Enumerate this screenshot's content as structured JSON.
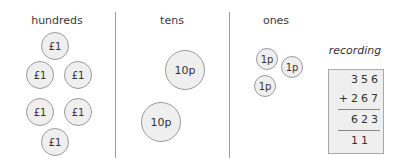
{
  "columns": {
    "hundreds": {
      "label": "hundreds",
      "coin_label": "£1",
      "count": 6
    },
    "tens": {
      "label": "tens",
      "coin_label": "10p",
      "count": 2
    },
    "ones": {
      "label": "ones",
      "coin_label": "1p",
      "count": 3
    }
  },
  "coins": {
    "hundreds": [
      "£1",
      "£1",
      "£1",
      "£1",
      "£1",
      "£1"
    ],
    "tens": [
      "10p",
      "10p"
    ],
    "ones": [
      "1p",
      "1p",
      "1p"
    ]
  },
  "recording": {
    "title": "recording",
    "addend1": "356",
    "addend2": "+267",
    "sum": "623",
    "carries": "11"
  },
  "colors": {
    "coin_fill": "#efefef",
    "coin_border": "#9a9a9a",
    "divider": "#9a9a9a",
    "box_fill": "#efefef"
  }
}
